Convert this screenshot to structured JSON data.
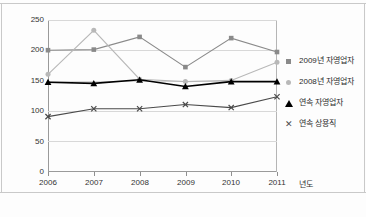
{
  "chart_data": {
    "type": "line",
    "title": "",
    "subtitle": "",
    "xlabel": "년도",
    "ylabel": "",
    "categories": [
      "2006",
      "2007",
      "2008",
      "2009",
      "2010",
      "2011"
    ],
    "x": [
      2006,
      2007,
      2008,
      2009,
      2010,
      2011
    ],
    "ylim": [
      0,
      250
    ],
    "yticks": [
      0,
      50,
      100,
      150,
      200,
      250
    ],
    "ytick_labels": [
      "0",
      "50",
      "100",
      "150",
      "200",
      "250"
    ],
    "grid": true,
    "legend_position": "right",
    "series": [
      {
        "name": "2009년 자영업자",
        "marker": "square",
        "color": "#8a8a8a",
        "values": [
          200,
          201,
          222,
          172,
          220,
          197
        ]
      },
      {
        "name": "2008년 자영업자",
        "marker": "circle",
        "color": "#b8b8b8",
        "values": [
          160,
          233,
          152,
          148,
          150,
          180
        ]
      },
      {
        "name": "연속 자영업자",
        "marker": "triangle",
        "color": "#000000",
        "values": [
          147,
          145,
          151,
          140,
          148,
          148
        ]
      },
      {
        "name": "연속 상용직",
        "marker": "x",
        "color": "#4a4a4a",
        "values": [
          90,
          103,
          103,
          110,
          105,
          123
        ]
      }
    ]
  },
  "axes": {
    "ytick_labels": [
      "250",
      "200",
      "150",
      "100",
      "50",
      "0"
    ],
    "xtick_labels": [
      "2006",
      "2007",
      "2008",
      "2009",
      "2010",
      "2011"
    ],
    "xaxis_title": "년도"
  },
  "legend": {
    "items": [
      {
        "label": "2009년 자영업자",
        "marker_name": "square-marker-icon"
      },
      {
        "label": "2008년 자영업자",
        "marker_name": "circle-marker-icon"
      },
      {
        "label": "연속 자영업자",
        "marker_name": "triangle-marker-icon"
      },
      {
        "label": "연속 상용직",
        "marker_name": "x-marker-icon"
      }
    ]
  },
  "colors": {
    "series_2009": "#8a8a8a",
    "series_2008": "#b8b8b8",
    "series_self_employed": "#000000",
    "series_regular": "#4a4a4a",
    "grid": "#d8d8d8",
    "axis": "#9a9a9a"
  }
}
